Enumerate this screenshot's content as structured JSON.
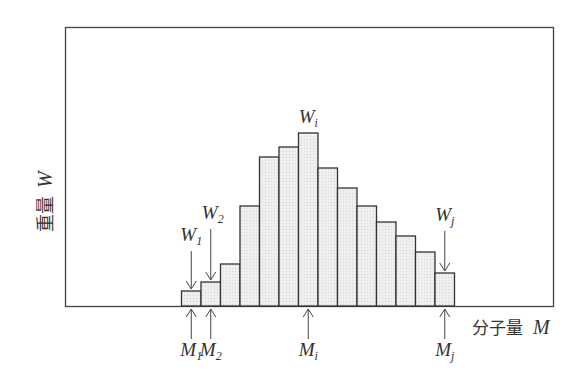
{
  "chart_data": {
    "type": "bar",
    "title": "",
    "xlabel": "分子量 M",
    "ylabel": "重量 W",
    "xlabel_text": "分子量",
    "xlabel_symbol": "M",
    "ylabel_text": "重量",
    "ylabel_symbol": "W",
    "grid": false,
    "legend": "none",
    "categories": [
      "M1",
      "M2",
      "3",
      "4",
      "5",
      "6",
      "Mi",
      "8",
      "9",
      "10",
      "11",
      "12",
      "13",
      "Mj"
    ],
    "values": [
      15,
      24,
      42,
      100,
      149,
      159,
      173,
      138,
      118,
      100,
      84,
      70,
      54,
      33
    ],
    "value_units": "relative height (px above baseline, qualitative)",
    "ylim": [
      0,
      279
    ],
    "annotations": {
      "top": [
        {
          "label": "W",
          "sub": "1",
          "bar_index": 0,
          "arrow": "down"
        },
        {
          "label": "W",
          "sub": "2",
          "bar_index": 1,
          "arrow": "down"
        },
        {
          "label": "W",
          "sub": "i",
          "bar_index": 6,
          "arrow": "none"
        },
        {
          "label": "W",
          "sub": "j",
          "bar_index": 13,
          "arrow": "down"
        }
      ],
      "bottom": [
        {
          "label": "M",
          "sub": "1",
          "bar_index": 0,
          "arrow": "up"
        },
        {
          "label": "M",
          "sub": "2",
          "bar_index": 1,
          "arrow": "up"
        },
        {
          "label": "M",
          "sub": "i",
          "bar_index": 6,
          "arrow": "up"
        },
        {
          "label": "M",
          "sub": "j",
          "bar_index": 13,
          "arrow": "up"
        }
      ]
    }
  },
  "colors": {
    "frame": "#444444",
    "bar_fill": "#ececec",
    "bar_stroke": "#333333",
    "text": "#333333"
  }
}
